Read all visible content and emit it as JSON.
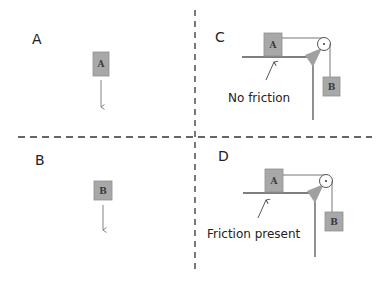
{
  "colors": {
    "block_fill": "#a8a8a8",
    "block_stroke": "#8a8a8a",
    "line": "#555555",
    "divider": "#333333",
    "support": "#a0a0a0"
  },
  "panels": {
    "A": {
      "label": "A",
      "block_label": "A",
      "motion": "arrow-down"
    },
    "B": {
      "label": "B",
      "block_label": "B",
      "motion": "arrow-down"
    },
    "C": {
      "label": "C",
      "block_on_table": "A",
      "hanging_block": "B",
      "annotation": "No friction"
    },
    "D": {
      "label": "D",
      "block_on_table": "A",
      "hanging_block": "B",
      "annotation": "Friction present"
    }
  }
}
